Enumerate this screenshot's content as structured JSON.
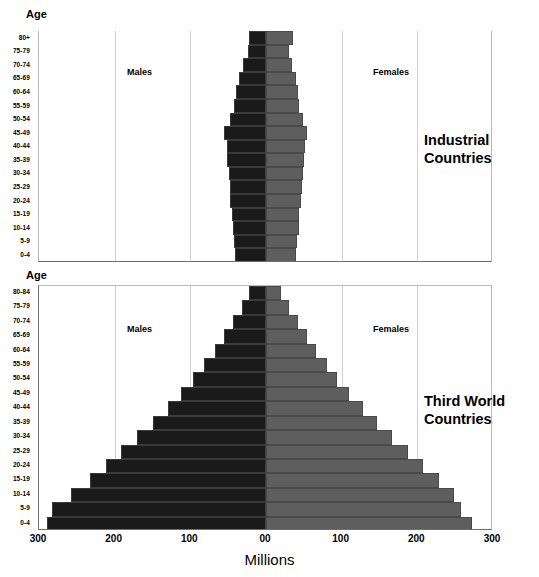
{
  "axis_headers": {
    "age_top": "Age",
    "age_bottom": "Age"
  },
  "panels": {
    "top": {
      "title_line1": "Industrial",
      "title_line2": "Countries",
      "male_label": "Males",
      "female_label": "Females"
    },
    "bottom": {
      "title_line1": "Third World",
      "title_line2": "Countries",
      "male_label": "Males",
      "female_label": "Females"
    }
  },
  "x_axis": {
    "title": "Millions",
    "ticks": [
      "300",
      "200",
      "100",
      "00",
      "100",
      "200",
      "300"
    ],
    "tick_values": [
      -300,
      -200,
      -100,
      0,
      100,
      200,
      300
    ],
    "min": -300,
    "max": 300
  },
  "colors": {
    "male": "#1a1a1a",
    "female": "#5e5e5e",
    "gridline": "#d2d2d2",
    "axis": "#6d6d6d",
    "background": "#ffffff"
  },
  "chart_data": [
    {
      "type": "bar",
      "title": "Industrial Countries",
      "orientation": "population-pyramid",
      "xlabel": "Millions",
      "ylabel": "Age",
      "xlim": [
        -300,
        300
      ],
      "grid": true,
      "legend_position": "in-plot",
      "categories": [
        "0-4",
        "5-9",
        "10-14",
        "15-19",
        "20-24",
        "25-29",
        "30-34",
        "35-39",
        "40-44",
        "45-49",
        "50-54",
        "55-59",
        "60-64",
        "65-69",
        "70-74",
        "75-79",
        "80+"
      ],
      "series": [
        {
          "name": "Males",
          "values": [
            -41,
            -42,
            -44,
            -45,
            -47,
            -48,
            -49,
            -51,
            -52,
            -55,
            -48,
            -42,
            -40,
            -36,
            -30,
            -24,
            -22
          ]
        },
        {
          "name": "Females",
          "values": [
            40,
            41,
            43,
            44,
            46,
            47,
            49,
            50,
            52,
            54,
            49,
            44,
            42,
            39,
            35,
            30,
            36
          ]
        }
      ]
    },
    {
      "type": "bar",
      "title": "Third World Countries",
      "orientation": "population-pyramid",
      "xlabel": "Millions",
      "ylabel": "Age",
      "xlim": [
        -300,
        300
      ],
      "grid": true,
      "legend_position": "in-plot",
      "categories": [
        "0-4",
        "5-9",
        "10-14",
        "15-19",
        "20-24",
        "25-29",
        "30-34",
        "35-39",
        "40-44",
        "45-49",
        "50-54",
        "55-59",
        "60-64",
        "65-69",
        "70-74",
        "75-79",
        "80-84"
      ],
      "series": [
        {
          "name": "Males",
          "values": [
            -290,
            -283,
            -258,
            -232,
            -212,
            -192,
            -170,
            -150,
            -130,
            -112,
            -96,
            -82,
            -68,
            -56,
            -44,
            -32,
            -22
          ]
        },
        {
          "name": "Females",
          "values": [
            272,
            258,
            248,
            228,
            208,
            188,
            166,
            147,
            128,
            110,
            94,
            80,
            66,
            54,
            42,
            30,
            20
          ]
        }
      ]
    }
  ]
}
